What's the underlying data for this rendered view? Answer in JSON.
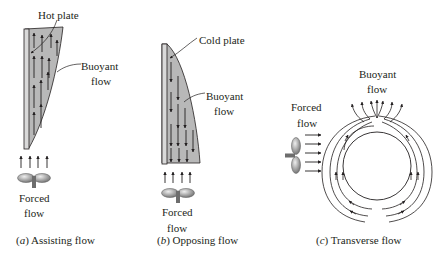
{
  "figure": {
    "panels": [
      {
        "id": "a",
        "caption_letter": "a",
        "caption_text": "Assisting flow",
        "plate_label": "Hot plate",
        "buoyant_label_line1": "Buoyant",
        "buoyant_label_line2": "flow",
        "forced_label_line1": "Forced",
        "forced_label_line2": "flow",
        "buoyant_direction": "up",
        "forced_direction": "up"
      },
      {
        "id": "b",
        "caption_letter": "b",
        "caption_text": "Opposing flow",
        "plate_label": "Cold plate",
        "buoyant_label_line1": "Buoyant",
        "buoyant_label_line2": "flow",
        "forced_label_line1": "Forced",
        "forced_label_line2": "flow",
        "buoyant_direction": "down",
        "forced_direction": "up"
      },
      {
        "id": "c",
        "caption_letter": "c",
        "caption_text": "Transverse flow",
        "buoyant_label_line1": "Buoyant",
        "buoyant_label_line2": "flow",
        "forced_label_line1": "Forced",
        "forced_label_line2": "flow",
        "buoyant_direction": "up",
        "forced_direction": "right"
      }
    ],
    "colors": {
      "ink": "#231f20",
      "fluid_fill": "#b8b8b8",
      "plate_fill": "#d9d9d9"
    }
  }
}
